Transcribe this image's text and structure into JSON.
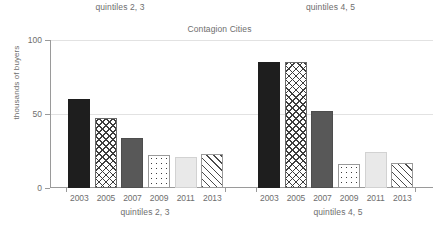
{
  "chart_data": {
    "type": "bar",
    "title": "Contagion Cities",
    "xlabel": "",
    "ylabel": "thousands of buyers",
    "ylim": [
      0,
      100
    ],
    "yticks": [
      0,
      50,
      100
    ],
    "ytick_labels": [
      "0",
      "50",
      "100"
    ],
    "grid": true,
    "legend": "none",
    "facet_layout": "1x2",
    "categories": [
      "2003",
      "2005",
      "2007",
      "2009",
      "2011",
      "2013"
    ],
    "panels": [
      {
        "strip_label": "quintiles 2, 3",
        "bottom_label": "quintiles 2, 3",
        "categories": [
          "2003",
          "2005",
          "2007",
          "2009",
          "2011",
          "2013"
        ],
        "values": [
          60,
          47,
          34,
          22,
          21,
          23
        ],
        "fills": [
          "solid-dark",
          "crosshatch",
          "solid-mid",
          "dots",
          "solid-light",
          "diagonal"
        ]
      },
      {
        "strip_label": "quintiles 4, 5",
        "bottom_label": "quintiles 4, 5",
        "categories": [
          "2003",
          "2005",
          "2007",
          "2009",
          "2011",
          "2013"
        ],
        "values": [
          85,
          85,
          52,
          16,
          24,
          17
        ],
        "fills": [
          "solid-dark",
          "crosshatch",
          "solid-mid",
          "dots",
          "solid-light",
          "diagonal"
        ]
      }
    ],
    "colors": {
      "solid_dark": "#1e1e1e",
      "solid_mid": "#585858",
      "solid_light": "#e9e9e9",
      "pattern_ink": "#3d3d3d",
      "axis": "#9a9a9a",
      "gridline": "#e2e2e2",
      "text": "#6e6e6e",
      "background": "#ffffff"
    }
  },
  "strip": {
    "left": "quintiles 2, 3",
    "right": "quintiles 4, 5"
  },
  "title": "Contagion Cities",
  "axes": {
    "y_title": "thousands of buyers",
    "y_tick_0": "0",
    "y_tick_50": "50",
    "y_tick_100": "100"
  },
  "xaxis": {
    "left": [
      "2003",
      "2005",
      "2007",
      "2009",
      "2011",
      "2013"
    ],
    "right": [
      "2003",
      "2005",
      "2007",
      "2009",
      "2011",
      "2013"
    ]
  },
  "bottom_strip": {
    "left": "quintiles 2, 3",
    "right": "quintiles 4, 5"
  }
}
